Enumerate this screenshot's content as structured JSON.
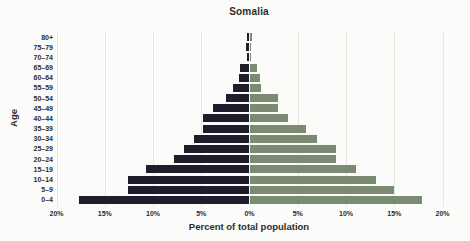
{
  "title": "Somalia",
  "colors": {
    "left_bar": "#1d1d2b",
    "right_bar": "#7b8a72",
    "grid": "#e7e7e2",
    "text": "#2d2d2d",
    "background": "#fbfbf9"
  },
  "chart_data": {
    "type": "bar",
    "subtype": "population-pyramid",
    "title": "Somalia",
    "xlabel": "Percent of total population",
    "ylabel": "Age",
    "grid": true,
    "xlim_each_side_pct": 20,
    "rows_top_to_bottom": [
      {
        "age": "80+",
        "left_pct": 0.3,
        "right_pct": 0.3
      },
      {
        "age": "75–79",
        "left_pct": 0.4,
        "right_pct": 0.2
      },
      {
        "age": "70–74",
        "left_pct": 0.3,
        "right_pct": 0.2
      },
      {
        "age": "65–69",
        "left_pct": 1.0,
        "right_pct": 0.8
      },
      {
        "age": "60–64",
        "left_pct": 1.1,
        "right_pct": 1.1
      },
      {
        "age": "55–59",
        "left_pct": 1.7,
        "right_pct": 1.2
      },
      {
        "age": "50–54",
        "left_pct": 2.4,
        "right_pct": 3.0
      },
      {
        "age": "45–49",
        "left_pct": 3.8,
        "right_pct": 3.0
      },
      {
        "age": "40–44",
        "left_pct": 4.8,
        "right_pct": 4.0
      },
      {
        "age": "35–39",
        "left_pct": 4.8,
        "right_pct": 5.9
      },
      {
        "age": "30–34",
        "left_pct": 5.8,
        "right_pct": 7.0
      },
      {
        "age": "25–29",
        "left_pct": 6.8,
        "right_pct": 9.0
      },
      {
        "age": "20–24",
        "left_pct": 7.8,
        "right_pct": 9.0
      },
      {
        "age": "15–19",
        "left_pct": 10.7,
        "right_pct": 11.0
      },
      {
        "age": "10–14",
        "left_pct": 12.6,
        "right_pct": 13.1
      },
      {
        "age": "5–9",
        "left_pct": 12.6,
        "right_pct": 15.0
      },
      {
        "age": "0–4",
        "left_pct": 17.7,
        "right_pct": 17.9
      }
    ],
    "series": [
      {
        "name": "left",
        "color": "#1d1d2b"
      },
      {
        "name": "right",
        "color": "#7b8a72"
      }
    ],
    "x_ticks": [
      {
        "pos": -20,
        "label": "20%"
      },
      {
        "pos": -15,
        "label": "15%"
      },
      {
        "pos": -10,
        "label": "10%"
      },
      {
        "pos": -5,
        "label": "5%"
      },
      {
        "pos": 0,
        "label": "0%"
      },
      {
        "pos": 5,
        "label": "5%"
      },
      {
        "pos": 10,
        "label": "10%"
      },
      {
        "pos": 15,
        "label": "15%"
      },
      {
        "pos": 20,
        "label": "20%"
      }
    ],
    "gridline_positions": [
      -20,
      -15,
      -10,
      -5,
      5,
      10,
      15,
      20
    ]
  }
}
